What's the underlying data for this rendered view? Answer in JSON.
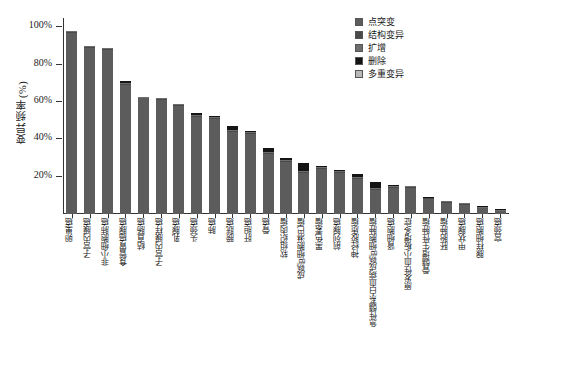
{
  "chart_data": {
    "type": "bar",
    "subtype": "stacked-bar",
    "title": "",
    "xlabel": "",
    "ylabel": "变异频率(%)",
    "ylim": [
      0,
      105
    ],
    "ytick_values": [
      20,
      40,
      60,
      80,
      100
    ],
    "ytick_labels": [
      "20%",
      "40%",
      "60%",
      "80%",
      "100%"
    ],
    "grid": false,
    "legend_position": "top-right",
    "categories": [
      "卵巢癌",
      "子宫内膜癌",
      "非小细胞肺癌",
      "食管胃癌腺癌",
      "结直肠癌",
      "子宫内膜样癌",
      "乳腺癌",
      "头颈癌",
      "肺癌",
      "膀胱癌",
      "肝胆癌",
      "骨癌",
      "软组织肉瘤",
      "成熟B细胞淋巴瘤",
      "黑色素瘤",
      "前列腺癌",
      "神经胶质瘤",
      "急性髓系白血病成熟B细胞肿瘤",
      "肾细胞癌",
      "原发性血小板增多症",
      "骨髓增生性肿瘤",
      "胚胎肿瘤",
      "甲状腺癌",
      "腺样细胞癌",
      "宫颈癌"
    ],
    "series": [
      {
        "name": "点突变",
        "color": "#5c5c5c",
        "values": [
          97,
          89,
          88,
          69,
          62,
          61,
          58,
          52,
          51,
          44,
          43,
          32,
          28,
          22,
          24,
          22,
          19,
          13,
          14,
          14,
          8,
          6,
          5,
          3,
          1.5
        ]
      },
      {
        "name": "结构变异",
        "color": "#4a4a4a",
        "values": [
          0.5,
          0.4,
          0.4,
          0.4,
          0.4,
          0.4,
          0.4,
          0.4,
          0.5,
          0.6,
          0.5,
          0.5,
          0.5,
          0.5,
          0.5,
          0.5,
          0.5,
          0.4,
          0.4,
          0.3,
          0.3,
          0.3,
          0.3,
          0.2,
          0.2
        ]
      },
      {
        "name": "扩增",
        "color": "#6e6e6e",
        "values": [
          0.5,
          0.4,
          0.4,
          0.6,
          0.4,
          0.6,
          0.6,
          0.5,
          0.5,
          0.6,
          0.6,
          0.7,
          0.7,
          0.8,
          0.6,
          0.5,
          0.6,
          0.5,
          0.4,
          0.4,
          0.3,
          0.3,
          0.3,
          0.2,
          0.2
        ]
      },
      {
        "name": "删除",
        "color": "#141414",
        "values": [
          0,
          0,
          0,
          1.2,
          0,
          0,
          0,
          1.2,
          0.6,
          2.2,
          0.6,
          2.0,
          1.0,
          4.0,
          0.7,
          0.6,
          1.2,
          3.2,
          0.6,
          0.4,
          0.3,
          0.3,
          0.3,
          0.3,
          0.2
        ]
      },
      {
        "name": "多重变异",
        "color": "#b8b8b8",
        "values": [
          0,
          0,
          0,
          0,
          0,
          0,
          0,
          0,
          0,
          0,
          0,
          0,
          0,
          0,
          0,
          0,
          0,
          0,
          0,
          0,
          0,
          0,
          0,
          0,
          0
        ]
      }
    ],
    "legend_entries": [
      {
        "label": "点突变",
        "color": "#5c5c5c"
      },
      {
        "label": "结构变异",
        "color": "#4a4a4a"
      },
      {
        "label": "扩增",
        "color": "#6e6e6e"
      },
      {
        "label": "删除",
        "color": "#141414"
      },
      {
        "label": "多重变异",
        "color": "#b8b8b8"
      }
    ]
  }
}
